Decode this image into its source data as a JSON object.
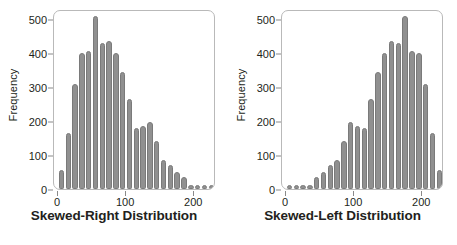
{
  "figure": {
    "background": "#ffffff",
    "bar_color": "#909090",
    "bar_edge_color": "#7a7a7a",
    "axis_color": "#b9b9b9",
    "text_color": "#231f20"
  },
  "chart_data": [
    {
      "type": "bar",
      "title": "Skewed-Right Distribution",
      "xlabel": "",
      "ylabel": "Frequency",
      "xlim": [
        -6,
        232
      ],
      "ylim": [
        0,
        530
      ],
      "xticks": [
        0,
        100,
        200
      ],
      "yticks": [
        0,
        100,
        200,
        300,
        400,
        500
      ],
      "grid": false,
      "legend": "none",
      "bin_width": 10,
      "categories": [
        5,
        15,
        25,
        35,
        45,
        55,
        65,
        75,
        85,
        95,
        105,
        115,
        125,
        135,
        145,
        155,
        165,
        175,
        185,
        195,
        205,
        215,
        225
      ],
      "values": [
        55,
        165,
        310,
        400,
        405,
        510,
        430,
        435,
        400,
        345,
        265,
        180,
        185,
        198,
        140,
        85,
        70,
        50,
        35,
        12,
        10,
        10,
        10
      ]
    },
    {
      "type": "bar",
      "title": "Skewed-Left Distribution",
      "xlabel": "",
      "ylabel": "Frequency",
      "xlim": [
        -6,
        232
      ],
      "ylim": [
        0,
        530
      ],
      "xticks": [
        0,
        100,
        200
      ],
      "yticks": [
        0,
        100,
        200,
        300,
        400,
        500
      ],
      "grid": false,
      "legend": "none",
      "bin_width": 10,
      "categories": [
        5,
        15,
        25,
        35,
        45,
        55,
        65,
        75,
        85,
        95,
        105,
        115,
        125,
        135,
        145,
        155,
        165,
        175,
        185,
        195,
        205,
        215,
        225
      ],
      "values": [
        10,
        10,
        10,
        12,
        35,
        50,
        70,
        85,
        140,
        198,
        185,
        180,
        265,
        345,
        400,
        435,
        430,
        510,
        405,
        400,
        310,
        165,
        55
      ]
    }
  ]
}
